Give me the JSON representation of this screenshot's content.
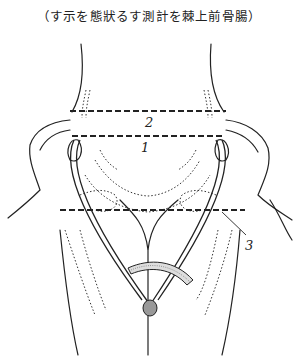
{
  "figure": {
    "caption": "（す示を態狀るす測計を棘上前骨腸）",
    "labels": [
      {
        "id": "1",
        "text": "1"
      },
      {
        "id": "2",
        "text": "2"
      },
      {
        "id": "3",
        "text": "3"
      }
    ],
    "ink_color": "#222222",
    "background": "#ffffff"
  }
}
